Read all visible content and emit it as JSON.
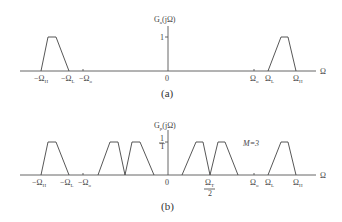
{
  "panel_a": {
    "caption": "(a)",
    "ylabel": "G",
    "ylabel_sub": "a",
    "ylabel_arg": "(jΩ)",
    "ytick": "1",
    "xaxis_label": "Ω",
    "xticks": {
      "neg_omega_h": "−Ω",
      "neg_omega_h_sub": "H",
      "neg_omega_l": "−Ω",
      "neg_omega_l_sub": "L",
      "neg_omega_o": "−Ω",
      "neg_omega_o_sub": "o",
      "zero": "0",
      "omega_o": "Ω",
      "omega_o_sub": "o",
      "omega_l": "Ω",
      "omega_l_sub": "L",
      "omega_h": "Ω",
      "omega_h_sub": "H"
    }
  },
  "panel_b": {
    "caption": "(b)",
    "ylabel": "G",
    "ylabel_sub": "p",
    "ylabel_arg": "(jΩ)",
    "ytick_num": "1",
    "ytick_den": "T",
    "annotation": "M=3",
    "xaxis_label": "Ω",
    "xticks": {
      "neg_omega_h": "−Ω",
      "neg_omega_h_sub": "H",
      "neg_omega_l": "−Ω",
      "neg_omega_l_sub": "L",
      "neg_omega_o": "−Ω",
      "neg_omega_o_sub": "o",
      "zero": "0",
      "omega_t_half_num": "Ω",
      "omega_t_half_sub": "T",
      "omega_t_half_den": "2",
      "omega_o": "Ω",
      "omega_o_sub": "o",
      "omega_l": "Ω",
      "omega_l_sub": "L",
      "omega_h": "Ω",
      "omega_h_sub": "H"
    }
  }
}
